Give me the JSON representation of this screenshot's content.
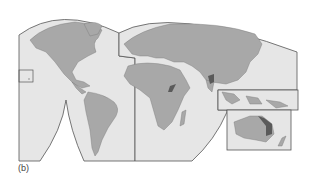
{
  "figure": {
    "caption": "(b)",
    "type": "interrupted world map projection",
    "colors": {
      "ocean": "#e6e6e6",
      "land": "#a8a8a8",
      "highlight": "#5a5a5a",
      "border": "#555555",
      "background": "#ffffff"
    },
    "lobes": [
      {
        "name": "Americas lobe"
      },
      {
        "name": "Eurasia-Africa lobe"
      }
    ],
    "insets": [
      {
        "name": "Hawaii inset"
      },
      {
        "name": "Southeast Asia inset"
      },
      {
        "name": "Australia inset"
      }
    ],
    "highlighted_regions": [
      "East African Rift",
      "Himalaya / Tibet region",
      "Eastern Australia highlands"
    ]
  }
}
